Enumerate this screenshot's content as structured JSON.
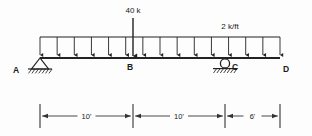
{
  "figure": {
    "type": "beam-load-diagram",
    "beam": {
      "start_x": 40,
      "end_x": 280,
      "y": 58
    },
    "nodes": [
      {
        "label": "A",
        "x": 40,
        "label_x": 16,
        "label_y": 73
      },
      {
        "label": "B",
        "x": 133,
        "label_x": 130,
        "label_y": 70
      },
      {
        "label": "C",
        "x": 225,
        "label_x": 235,
        "label_y": 70
      },
      {
        "label": "D",
        "x": 280,
        "label_x": 286,
        "label_y": 72
      }
    ],
    "supports": [
      {
        "kind": "pin",
        "at": "A",
        "x": 40,
        "name": "pinned-support-a"
      },
      {
        "kind": "roller",
        "at": "C",
        "x": 225,
        "name": "roller-support-c"
      }
    ],
    "point_load": {
      "label": "40 k",
      "magnitude": 40,
      "unit": "k",
      "x": 133,
      "label_x": 133,
      "label_y": 13,
      "arrow_top_y": 18,
      "arrow_bottom_y": 56
    },
    "distributed_load": {
      "label": "2 k/ft",
      "magnitude": 2,
      "unit": "k/ft",
      "label_x": 230,
      "label_y": 29,
      "top_y": 37,
      "bottom_y": 55,
      "start_x": 40,
      "end_x": 280,
      "arrow_count": 14
    },
    "dimensions": [
      {
        "label": "10'",
        "from_x": 40,
        "to_x": 133,
        "y": 116,
        "value": 10,
        "unit": "ft"
      },
      {
        "label": "10'",
        "from_x": 133,
        "to_x": 225,
        "y": 116,
        "value": 10,
        "unit": "ft"
      },
      {
        "label": "6'",
        "from_x": 225,
        "to_x": 280,
        "y": 116,
        "value": 6,
        "unit": "ft"
      }
    ],
    "colors": {
      "line": "#222222",
      "text": "#1a1a1a",
      "background": "#fdfdfd"
    }
  }
}
